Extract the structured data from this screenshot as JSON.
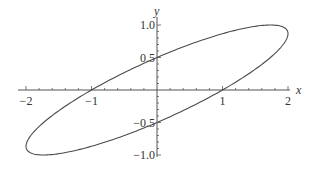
{
  "chart_data": {
    "type": "line",
    "title": "",
    "xlabel": "x",
    "ylabel": "y",
    "xlim": [
      -2,
      2
    ],
    "ylim": [
      -1,
      1
    ],
    "grid": false,
    "curve": {
      "description": "Ellipse x^2 - 2*sqrt(3)*x*y + 4*y^2 = 1, parametrized x = 2cos t, y = sin(t + pi/3)",
      "param": "t",
      "t_range": [
        0,
        6.2832
      ],
      "x_expr": "2*cos(t)",
      "y_expr": "sin(t + pi/3)",
      "key_points": [
        {
          "x": 2,
          "y": 0.866
        },
        {
          "x": 1.732,
          "y": 1.0
        },
        {
          "x": 0,
          "y": 0.5
        },
        {
          "x": -1,
          "y": 0
        },
        {
          "x": -2,
          "y": -0.866
        },
        {
          "x": -1.732,
          "y": -1.0
        },
        {
          "x": 0,
          "y": -0.5
        },
        {
          "x": 1,
          "y": 0
        }
      ]
    },
    "x_ticks": [
      {
        "value": -2,
        "label": "−2"
      },
      {
        "value": -1,
        "label": "−1"
      },
      {
        "value": 1,
        "label": "1"
      },
      {
        "value": 2,
        "label": "2"
      }
    ],
    "y_ticks": [
      {
        "value": 1.0,
        "label": "1.0"
      },
      {
        "value": 0.5,
        "label": "0.5"
      },
      {
        "value": -0.5,
        "label": "−0.5"
      },
      {
        "value": -1.0,
        "label": "−1.0"
      }
    ],
    "x_minor_step": 0.2,
    "y_minor_step": 0.1,
    "colors": {
      "curve": "#4a4a4a",
      "axis": "#555555",
      "background": "#ffffff"
    }
  }
}
